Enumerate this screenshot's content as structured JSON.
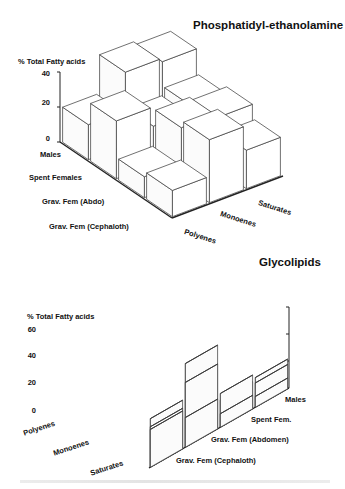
{
  "chart_data": [
    {
      "type": "bar3d",
      "title": "Phosphatidyl-ethanolamine",
      "ylabel": "% Total Fatty acids",
      "yticks": [
        "0",
        "20",
        "40"
      ],
      "ylim": [
        0,
        40
      ],
      "categories_depth": [
        "Males",
        "Spent Females",
        "Grav. Fem (Abdo)",
        "Grav. Fem (Cephaloth)"
      ],
      "categories_x": [
        "Polyenes",
        "Monoenes",
        "Saturates"
      ],
      "series": [
        {
          "name": "Males",
          "values": [
            20,
            42,
            40
          ]
        },
        {
          "name": "Spent Females",
          "values": [
            33,
            22,
            26
          ]
        },
        {
          "name": "Grav. Fem (Abdo)",
          "values": [
            12,
            32,
            30
          ]
        },
        {
          "name": "Grav. Fem (Cephaloth)",
          "values": [
            15,
            36,
            22
          ]
        }
      ],
      "grid": false,
      "legend": "none"
    },
    {
      "type": "bar3d",
      "title": "Glycolipids",
      "ylabel": "% Total Fatty acids",
      "yticks": [
        "0",
        "20",
        "40",
        "60"
      ],
      "ylim": [
        0,
        60
      ],
      "categories_depth": [
        "Males",
        "Spent Fem.",
        "Grav. Fem (Abdomen)",
        "Grav. Fem (Cephaloth)"
      ],
      "categories_x": [
        "Polyenes",
        "Monoenes",
        "Saturates"
      ],
      "series": [
        {
          "name": "Males",
          "values": [
            8,
            18,
            22
          ]
        },
        {
          "name": "Spent Fem.",
          "values": [
            10,
            25,
            20
          ]
        },
        {
          "name": "Grav. Fem (Abdomen)",
          "values": [
            22,
            48,
            62
          ]
        },
        {
          "name": "Grav. Fem (Cephaloth)",
          "values": [
            28,
            30,
            36
          ]
        }
      ],
      "grid": false,
      "legend": "none"
    }
  ],
  "top": {
    "title": "Phosphatidyl-ethanolamine",
    "ylabel": "% Total Fatty acids",
    "ticks": [
      "40",
      "20",
      "0"
    ],
    "depth_labels": [
      "Males",
      "Spent Females",
      "Grav. Fem (Abdo)",
      "Grav. Fem (Cephaloth)"
    ],
    "x_labels": [
      "Polyenes",
      "Monoenes",
      "Saturates"
    ]
  },
  "bottom": {
    "title": "Glycolipids",
    "ylabel": "% Total Fatty acids",
    "ticks": [
      "60",
      "40",
      "20",
      "0"
    ],
    "x_labels": [
      "Polyenes",
      "Monoenes",
      "Saturates"
    ],
    "depth_labels": [
      "Males",
      "Spent Fem.",
      "Grav. Fem (Abdomen)",
      "Grav. Fem (Cephaloth)"
    ]
  }
}
